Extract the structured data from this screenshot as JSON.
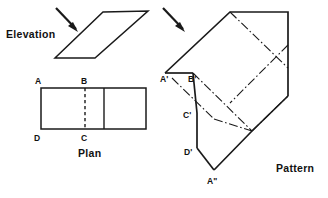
{
  "figure": {
    "title_labels": {
      "elevation": "Elevation",
      "plan": "Plan",
      "pattern": "Pattern"
    },
    "point_labels": {
      "a": "A",
      "b": "B",
      "c": "C",
      "d": "D",
      "a_prime": "A'",
      "b_prime": "B'",
      "c_prime": "C'",
      "d_prime": "D'",
      "a_double_prime": "A\""
    },
    "icons": {
      "elevation_arrow": "arrow-down-right-icon",
      "pattern_arrow": "arrow-down-right-icon"
    },
    "colors": {
      "line": "#1a1a1a",
      "background": "#ffffff",
      "text": "#111111"
    },
    "line_styles": {
      "solid": "visible-edge",
      "dashed": "hidden-edge",
      "dash_dot": "fold-line"
    }
  }
}
